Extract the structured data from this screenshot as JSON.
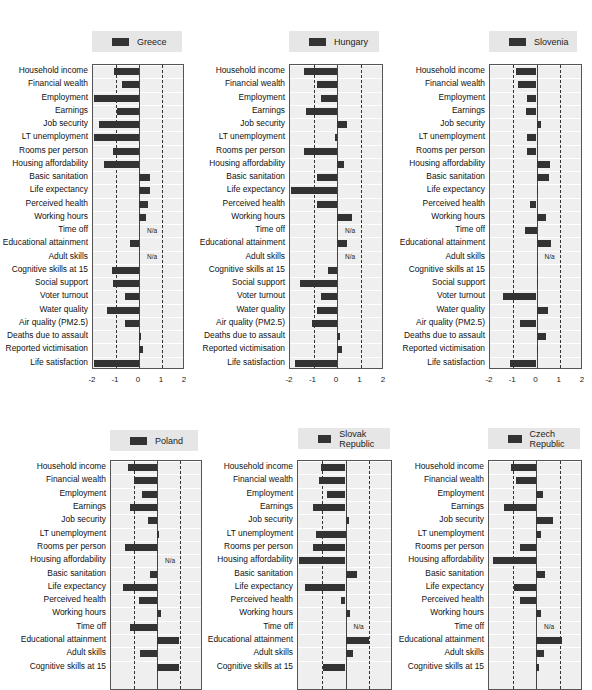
{
  "chart_data": [
    {
      "type": "bar",
      "orientation": "horizontal",
      "title": "Greece",
      "xlim": [
        -2,
        2
      ],
      "xticks": [
        "-2",
        "-1",
        "0",
        "1",
        "2"
      ],
      "categories": [
        "Household income",
        "Financial wealth",
        "Employment",
        "Earnings",
        "Job security",
        "LT unemployment",
        "Rooms per person",
        "Housing affordability",
        "Basic sanitation",
        "Life expectancy",
        "Perceived health",
        "Working hours",
        "Time off",
        "Educational attainment",
        "Adult skills",
        "Cognitive skills at 15",
        "Social support",
        "Voter turnout",
        "Water quality",
        "Air quality (PM2.5)",
        "Deaths due to assault",
        "Reported victimisation",
        "Life satisfaction"
      ],
      "values": [
        -1.09,
        -0.73,
        -1.97,
        -0.97,
        -1.76,
        -1.97,
        -1.14,
        -1.53,
        0.47,
        0.46,
        0.4,
        0.3,
        null,
        -0.39,
        null,
        -1.17,
        -1.13,
        -0.6,
        -1.39,
        -0.59,
        0.07,
        0.17,
        -1.96
      ],
      "na_label": "N/a",
      "dashed_reference_lines": [
        -1,
        1
      ]
    },
    {
      "type": "bar",
      "orientation": "horizontal",
      "title": "Hungary",
      "xlim": [
        -2,
        2
      ],
      "xticks": [
        "-2",
        "-1",
        "0",
        "1",
        "2"
      ],
      "categories": [
        "Household income",
        "Financial wealth",
        "Employment",
        "Earnings",
        "Job security",
        "LT unemployment",
        "Rooms per person",
        "Housing affordability",
        "Basic sanitation",
        "Life expectancy",
        "Perceived health",
        "Working hours",
        "Time off",
        "Educational attainment",
        "Adult skills",
        "Cognitive skills at 15",
        "Social support",
        "Voter turnout",
        "Water quality",
        "Air quality (PM2.5)",
        "Deaths due to assault",
        "Reported victimisation",
        "Life satisfaction"
      ],
      "values": [
        -1.4,
        -0.86,
        -0.69,
        -1.34,
        0.44,
        -0.07,
        -1.39,
        0.31,
        -0.84,
        -1.97,
        -0.87,
        0.64,
        null,
        0.41,
        null,
        -0.4,
        -1.57,
        -0.67,
        -0.86,
        -1.07,
        0.14,
        0.2,
        -1.77
      ],
      "na_label": "N/a",
      "dashed_reference_lines": [
        -1,
        1
      ]
    },
    {
      "type": "bar",
      "orientation": "horizontal",
      "title": "Slovenia",
      "xlim": [
        -2,
        2
      ],
      "xticks": [
        "-2",
        "-1",
        "0",
        "1",
        "2"
      ],
      "categories": [
        "Household income",
        "Financial wealth",
        "Employment",
        "Earnings",
        "Job security",
        "LT unemployment",
        "Rooms per person",
        "Housing affordability",
        "Basic sanitation",
        "Life expectancy",
        "Perceived health",
        "Working hours",
        "Time off",
        "Educational attainment",
        "Adult skills",
        "Cognitive skills at 15",
        "Social support",
        "Voter turnout",
        "Water quality",
        "Air quality (PM2.5)",
        "Deaths due to assault",
        "Reported victimisation",
        "Life satisfaction"
      ],
      "values": [
        -0.87,
        -0.8,
        -0.39,
        -0.44,
        0.19,
        -0.41,
        -0.43,
        0.6,
        0.53,
        0.0,
        -0.3,
        0.39,
        -0.5,
        0.63,
        null,
        0.07,
        0.07,
        -1.46,
        0.5,
        -0.71,
        0.4,
        0.07,
        -1.13
      ],
      "na_label": "N/a",
      "dashed_reference_lines": [
        -1,
        1
      ]
    },
    {
      "type": "bar",
      "orientation": "horizontal",
      "title": "Poland",
      "xlim": [
        -2,
        2
      ],
      "categories": [
        "Household income",
        "Financial wealth",
        "Employment",
        "Earnings",
        "Job security",
        "LT unemployment",
        "Rooms per person",
        "Housing affordability",
        "Basic sanitation",
        "Life expectancy",
        "Perceived health",
        "Working hours",
        "Time off",
        "Educational attainment",
        "Adult skills",
        "Cognitive skills at 15"
      ],
      "values": [
        -1.24,
        -1.0,
        -0.66,
        -1.19,
        -0.4,
        0.06,
        -1.4,
        null,
        -0.32,
        -1.49,
        -0.78,
        0.16,
        -1.18,
        0.96,
        -0.74,
        0.94
      ],
      "na_label": "N/a",
      "dashed_reference_lines": [
        -1,
        1
      ]
    },
    {
      "type": "bar",
      "orientation": "horizontal",
      "title": "Slovak Republic",
      "xlim": [
        -2,
        2
      ],
      "categories": [
        "Household income",
        "Financial wealth",
        "Employment",
        "Earnings",
        "Job security",
        "LT unemployment",
        "Rooms per person",
        "Housing affordability",
        "Basic sanitation",
        "Life expectancy",
        "Perceived health",
        "Working hours",
        "Time off",
        "Educational attainment",
        "Adult skills",
        "Cognitive skills at 15"
      ],
      "values": [
        -1.04,
        -1.11,
        -0.76,
        -1.37,
        0.13,
        -1.25,
        -1.37,
        -1.96,
        0.48,
        -1.72,
        -0.21,
        0.2,
        null,
        1.01,
        0.32,
        -0.94
      ],
      "na_label": "N/a",
      "dashed_reference_lines": [
        -1,
        1
      ]
    },
    {
      "type": "bar",
      "orientation": "horizontal",
      "title": "Czech Republic",
      "xlim": [
        -2,
        2
      ],
      "categories": [
        "Household income",
        "Financial wealth",
        "Employment",
        "Earnings",
        "Job security",
        "LT unemployment",
        "Rooms per person",
        "Housing affordability",
        "Basic sanitation",
        "Life expectancy",
        "Perceived health",
        "Working hours",
        "Time off",
        "Educational attainment",
        "Adult skills",
        "Cognitive skills at 15"
      ],
      "values": [
        -1.07,
        -0.83,
        0.29,
        -1.36,
        0.74,
        0.23,
        -0.69,
        -1.83,
        0.4,
        -0.94,
        -0.7,
        0.2,
        null,
        1.1,
        0.34,
        0.13
      ],
      "na_label": "N/a",
      "dashed_reference_lines": [
        -1,
        1
      ]
    }
  ],
  "colors": {
    "bar": "#333333",
    "plot_bg": "#efefef",
    "legend_bg": "#e6e6e6"
  },
  "layout": [
    {
      "legend": [
        92,
        31,
        90
      ],
      "box": [
        92,
        64,
        92,
        305
      ],
      "row_h": 13.25,
      "axis": true
    },
    {
      "legend": [
        289,
        31,
        90
      ],
      "box": [
        289,
        64,
        94,
        305
      ],
      "row_h": 13.25,
      "axis": true
    },
    {
      "legend": [
        489,
        31,
        88
      ],
      "box": [
        489,
        64,
        93,
        305
      ],
      "row_h": 13.25,
      "axis": true
    },
    {
      "legend": [
        110,
        430,
        88
      ],
      "box": [
        110,
        460,
        92,
        230
      ],
      "row_h": 13.3,
      "axis": false
    },
    {
      "legend": [
        298,
        428,
        92
      ],
      "box": [
        297,
        460,
        95,
        230
      ],
      "row_h": 13.3,
      "axis": false
    },
    {
      "legend": [
        488,
        428,
        92
      ],
      "box": [
        488,
        460,
        94,
        230
      ],
      "row_h": 13.3,
      "axis": false
    }
  ]
}
